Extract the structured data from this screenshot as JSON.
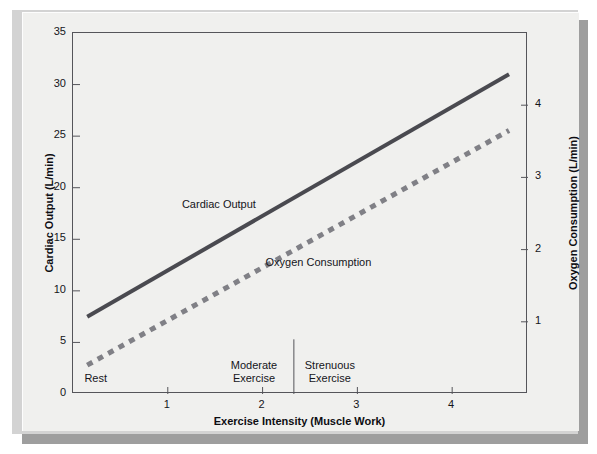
{
  "chart_data": {
    "type": "line",
    "title": "",
    "xlabel": "Exercise Intensity (Muscle Work)",
    "ylabel": "Cardiac Output (L/min)",
    "y2label": "Oxygen Consumption (L/min)",
    "xlim": [
      0,
      4.8
    ],
    "ylim": [
      0,
      35
    ],
    "y2lim": [
      0,
      5
    ],
    "xticks": [
      1,
      2,
      3,
      4
    ],
    "xtick_labels": [
      "1",
      "2",
      "3",
      "4"
    ],
    "yticks": [
      0,
      5,
      10,
      15,
      20,
      25,
      30,
      35
    ],
    "ytick_labels": [
      "0",
      "5",
      "10",
      "15",
      "20",
      "25",
      "30",
      "35"
    ],
    "y2ticks": [
      1,
      2,
      3,
      4
    ],
    "y2tick_labels": [
      "1",
      "2",
      "3",
      "4"
    ],
    "grid": false,
    "legend_position": "inline-annotations",
    "series": [
      {
        "name": "Cardiac Output",
        "axis": "left",
        "style": "solid",
        "color": "#4a4a50",
        "width": 4,
        "x": [
          0.15,
          4.6
        ],
        "values": [
          7.5,
          31.0
        ]
      },
      {
        "name": "Oxygen Consumption",
        "axis": "right",
        "style": "dashed",
        "color": "#808086",
        "width": 5,
        "x": [
          0.15,
          4.6
        ],
        "values": [
          0.4,
          3.65
        ]
      }
    ],
    "annotations": [
      {
        "text": "Cardiac Output",
        "x": 1.55,
        "y": 18.2,
        "kind": "series-label"
      },
      {
        "text": "Oxygen Consumption",
        "x": 2.6,
        "y": 12.6,
        "kind": "series-label"
      }
    ],
    "zones": [
      {
        "label": "Rest",
        "lines": [
          "Rest"
        ],
        "x": 0.25
      },
      {
        "label": "Moderate Exercise",
        "lines": [
          "Moderate",
          "Exercise"
        ],
        "x": 1.92
      },
      {
        "label": "Strenuous Exercise",
        "lines": [
          "Strenuous",
          "Exercise"
        ],
        "x": 2.72
      }
    ],
    "dividers": [
      {
        "x": 2.33,
        "y_from": 0,
        "y_to": 5.3
      }
    ]
  },
  "axes": {
    "left_title": "Cardiac Output (L/min)",
    "right_title": "Oxygen Consumption (L/min)",
    "bottom_title": "Exercise Intensity (Muscle Work)"
  },
  "colors": {
    "panel_face": "#f0f0ee",
    "panel_bevel": "#d3d3d3",
    "panel_shadow": "#9e9e9e",
    "axis": "#55555a",
    "cardiac_line": "#4a4a50",
    "oxygen_line": "#808086",
    "text": "#15151a"
  }
}
